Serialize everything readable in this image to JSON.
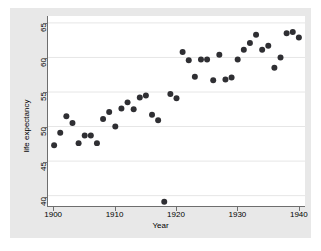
{
  "chart_data": {
    "type": "scatter",
    "title": "",
    "xlabel": "Year",
    "ylabel": "life expectancy",
    "xlim": [
      1899,
      1941
    ],
    "ylim": [
      38.5,
      66
    ],
    "xticks": [
      1900,
      1910,
      1920,
      1930,
      1940
    ],
    "yticks": [
      40,
      45,
      50,
      55,
      60,
      65
    ],
    "grid": "horizontal",
    "legend": "none",
    "marker_color": "#2f2f33",
    "marker_size": 3,
    "background_color": "#e8e8e8",
    "plot_background_color": "#ffffff",
    "x": [
      1900,
      1901,
      1902,
      1903,
      1904,
      1905,
      1906,
      1907,
      1908,
      1909,
      1910,
      1911,
      1912,
      1913,
      1914,
      1915,
      1916,
      1917,
      1918,
      1919,
      1920,
      1921,
      1922,
      1923,
      1924,
      1925,
      1926,
      1927,
      1928,
      1929,
      1930,
      1931,
      1932,
      1933,
      1934,
      1935,
      1936,
      1937,
      1938,
      1939,
      1940
    ],
    "y": [
      47.3,
      49.1,
      51.5,
      50.5,
      47.6,
      48.7,
      48.7,
      47.6,
      51.1,
      52.1,
      50.0,
      52.6,
      53.5,
      52.5,
      54.2,
      54.5,
      51.7,
      50.9,
      39.1,
      54.7,
      54.1,
      60.8,
      59.6,
      57.2,
      59.7,
      59.7,
      56.7,
      60.4,
      56.8,
      57.1,
      59.7,
      61.1,
      62.1,
      63.3,
      61.1,
      61.7,
      58.5,
      60.0,
      63.5,
      63.7,
      62.9
    ],
    "points": [
      {
        "year": 1900,
        "life_expectancy": 47.3
      },
      {
        "year": 1901,
        "life_expectancy": 49.1
      },
      {
        "year": 1902,
        "life_expectancy": 51.5
      },
      {
        "year": 1903,
        "life_expectancy": 50.5
      },
      {
        "year": 1904,
        "life_expectancy": 47.6
      },
      {
        "year": 1905,
        "life_expectancy": 48.7
      },
      {
        "year": 1906,
        "life_expectancy": 48.7
      },
      {
        "year": 1907,
        "life_expectancy": 47.6
      },
      {
        "year": 1908,
        "life_expectancy": 51.1
      },
      {
        "year": 1909,
        "life_expectancy": 52.1
      },
      {
        "year": 1910,
        "life_expectancy": 50.0
      },
      {
        "year": 1911,
        "life_expectancy": 52.6
      },
      {
        "year": 1912,
        "life_expectancy": 53.5
      },
      {
        "year": 1913,
        "life_expectancy": 52.5
      },
      {
        "year": 1914,
        "life_expectancy": 54.2
      },
      {
        "year": 1915,
        "life_expectancy": 54.5
      },
      {
        "year": 1916,
        "life_expectancy": 51.7
      },
      {
        "year": 1917,
        "life_expectancy": 50.9
      },
      {
        "year": 1918,
        "life_expectancy": 39.1
      },
      {
        "year": 1919,
        "life_expectancy": 54.7
      },
      {
        "year": 1920,
        "life_expectancy": 54.1
      },
      {
        "year": 1921,
        "life_expectancy": 60.8
      },
      {
        "year": 1922,
        "life_expectancy": 59.6
      },
      {
        "year": 1923,
        "life_expectancy": 57.2
      },
      {
        "year": 1924,
        "life_expectancy": 59.7
      },
      {
        "year": 1925,
        "life_expectancy": 59.7
      },
      {
        "year": 1926,
        "life_expectancy": 56.7
      },
      {
        "year": 1927,
        "life_expectancy": 60.4
      },
      {
        "year": 1928,
        "life_expectancy": 56.8
      },
      {
        "year": 1929,
        "life_expectancy": 57.1
      },
      {
        "year": 1930,
        "life_expectancy": 59.7
      },
      {
        "year": 1931,
        "life_expectancy": 61.1
      },
      {
        "year": 1932,
        "life_expectancy": 62.1
      },
      {
        "year": 1933,
        "life_expectancy": 63.3
      },
      {
        "year": 1934,
        "life_expectancy": 61.1
      },
      {
        "year": 1935,
        "life_expectancy": 61.7
      },
      {
        "year": 1936,
        "life_expectancy": 58.5
      },
      {
        "year": 1937,
        "life_expectancy": 60.0
      },
      {
        "year": 1938,
        "life_expectancy": 63.5
      },
      {
        "year": 1939,
        "life_expectancy": 63.7
      },
      {
        "year": 1940,
        "life_expectancy": 62.9
      }
    ]
  }
}
